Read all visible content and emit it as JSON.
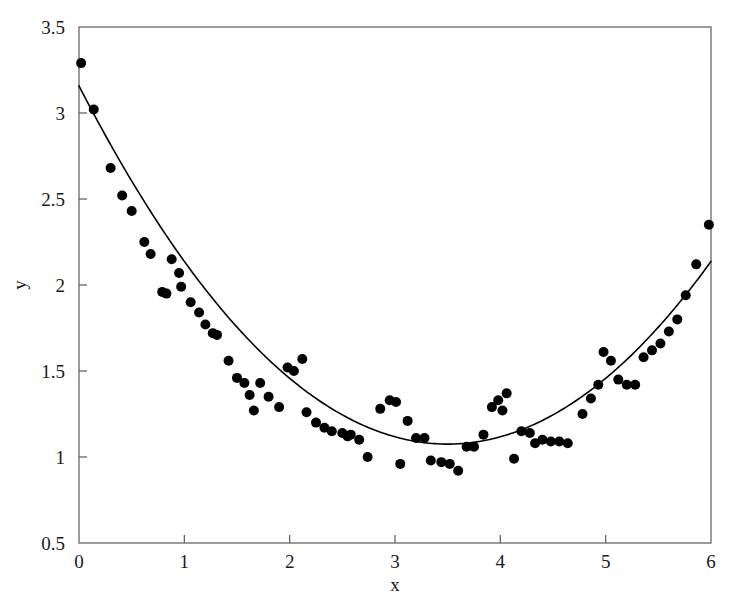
{
  "chart_data": {
    "type": "scatter",
    "title": "",
    "xlabel": "x",
    "ylabel": "y",
    "xlim": [
      0,
      6
    ],
    "ylim": [
      0.5,
      3.5
    ],
    "xticks": [
      0,
      1,
      2,
      3,
      4,
      5,
      6
    ],
    "xtick_labels": [
      "0",
      "1",
      "2",
      "3",
      "4",
      "5",
      "6"
    ],
    "yticks": [
      0.5,
      1,
      1.5,
      2,
      2.5,
      3,
      3.5
    ],
    "ytick_labels": [
      "0.5",
      "1",
      "1.5",
      "2",
      "2.5",
      "3",
      "3.5"
    ],
    "grid": false,
    "legend": null,
    "marker_color": "#000000",
    "marker_size": 5,
    "line_color": "#000000",
    "line_width": 1.6,
    "frame_color": "#5a5a5a",
    "background": "#ffffff",
    "series": [
      {
        "name": "observations",
        "type": "scatter",
        "points": [
          [
            0.02,
            3.29
          ],
          [
            0.14,
            3.02
          ],
          [
            0.3,
            2.68
          ],
          [
            0.41,
            2.52
          ],
          [
            0.5,
            2.43
          ],
          [
            0.62,
            2.25
          ],
          [
            0.68,
            2.18
          ],
          [
            0.79,
            1.96
          ],
          [
            0.83,
            1.95
          ],
          [
            0.88,
            2.15
          ],
          [
            0.95,
            2.07
          ],
          [
            0.97,
            1.99
          ],
          [
            1.06,
            1.9
          ],
          [
            1.14,
            1.84
          ],
          [
            1.2,
            1.77
          ],
          [
            1.27,
            1.72
          ],
          [
            1.31,
            1.71
          ],
          [
            1.42,
            1.56
          ],
          [
            1.5,
            1.46
          ],
          [
            1.57,
            1.43
          ],
          [
            1.62,
            1.36
          ],
          [
            1.66,
            1.27
          ],
          [
            1.72,
            1.43
          ],
          [
            1.8,
            1.35
          ],
          [
            1.9,
            1.29
          ],
          [
            1.98,
            1.52
          ],
          [
            2.04,
            1.5
          ],
          [
            2.12,
            1.57
          ],
          [
            2.16,
            1.26
          ],
          [
            2.25,
            1.2
          ],
          [
            2.33,
            1.17
          ],
          [
            2.4,
            1.15
          ],
          [
            2.5,
            1.14
          ],
          [
            2.55,
            1.12
          ],
          [
            2.58,
            1.13
          ],
          [
            2.66,
            1.1
          ],
          [
            2.74,
            1.0
          ],
          [
            2.86,
            1.28
          ],
          [
            2.95,
            1.33
          ],
          [
            3.01,
            1.32
          ],
          [
            3.05,
            0.96
          ],
          [
            3.12,
            1.21
          ],
          [
            3.2,
            1.11
          ],
          [
            3.28,
            1.11
          ],
          [
            3.34,
            0.98
          ],
          [
            3.44,
            0.97
          ],
          [
            3.52,
            0.96
          ],
          [
            3.6,
            0.92
          ],
          [
            3.68,
            1.06
          ],
          [
            3.75,
            1.06
          ],
          [
            3.84,
            1.13
          ],
          [
            3.92,
            1.29
          ],
          [
            3.98,
            1.33
          ],
          [
            4.02,
            1.27
          ],
          [
            4.06,
            1.37
          ],
          [
            4.13,
            0.99
          ],
          [
            4.2,
            1.15
          ],
          [
            4.28,
            1.14
          ],
          [
            4.33,
            1.08
          ],
          [
            4.4,
            1.1
          ],
          [
            4.48,
            1.09
          ],
          [
            4.56,
            1.09
          ],
          [
            4.64,
            1.08
          ],
          [
            4.78,
            1.25
          ],
          [
            4.86,
            1.34
          ],
          [
            4.93,
            1.42
          ],
          [
            4.98,
            1.61
          ],
          [
            5.05,
            1.56
          ],
          [
            5.12,
            1.45
          ],
          [
            5.2,
            1.42
          ],
          [
            5.28,
            1.42
          ],
          [
            5.36,
            1.58
          ],
          [
            5.44,
            1.62
          ],
          [
            5.52,
            1.66
          ],
          [
            5.6,
            1.73
          ],
          [
            5.68,
            1.8
          ],
          [
            5.76,
            1.94
          ],
          [
            5.86,
            2.12
          ],
          [
            5.98,
            2.35
          ]
        ]
      },
      {
        "name": "fitted-curve",
        "type": "line",
        "model": "quadratic",
        "equation": "y = 0.170*(x - 3.50)^2 + 1.075",
        "vertex": [
          3.5,
          1.075
        ],
        "endpoints": [
          [
            0,
            3.158
          ],
          [
            6,
            2.138
          ]
        ],
        "samples": [
          [
            0.0,
            3.13
          ],
          [
            0.25,
            2.86
          ],
          [
            0.5,
            2.6
          ],
          [
            0.75,
            2.36
          ],
          [
            1.0,
            2.14
          ],
          [
            1.25,
            1.94
          ],
          [
            1.5,
            1.76
          ],
          [
            1.75,
            1.6
          ],
          [
            2.0,
            1.46
          ],
          [
            2.25,
            1.35
          ],
          [
            2.5,
            1.25
          ],
          [
            2.75,
            1.18
          ],
          [
            3.0,
            1.13
          ],
          [
            3.25,
            1.09
          ],
          [
            3.5,
            1.08
          ],
          [
            3.75,
            1.09
          ],
          [
            4.0,
            1.12
          ],
          [
            4.25,
            1.18
          ],
          [
            4.5,
            1.26
          ],
          [
            4.75,
            1.36
          ],
          [
            5.0,
            1.48
          ],
          [
            5.25,
            1.62
          ],
          [
            5.5,
            1.76
          ],
          [
            5.75,
            1.96
          ],
          [
            6.0,
            2.28
          ]
        ]
      }
    ]
  }
}
